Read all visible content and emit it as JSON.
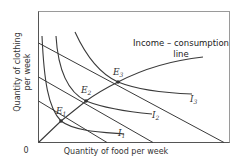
{
  "diagram": {
    "title_line1": "Income – consumption",
    "title_line2": "line",
    "x_axis_label": "Quantity of food per week",
    "y_axis_label_line1": "Quantity of clothing",
    "y_axis_label_line2": "per week",
    "origin_label": "0",
    "equilibria": [
      {
        "letter": "E",
        "sub": "1"
      },
      {
        "letter": "E",
        "sub": "2"
      },
      {
        "letter": "E",
        "sub": "3"
      }
    ],
    "indifference_curves": [
      {
        "letter": "I",
        "sub": "1"
      },
      {
        "letter": "I",
        "sub": "2"
      },
      {
        "letter": "I",
        "sub": "3"
      }
    ],
    "budget_lines_count": 3
  }
}
